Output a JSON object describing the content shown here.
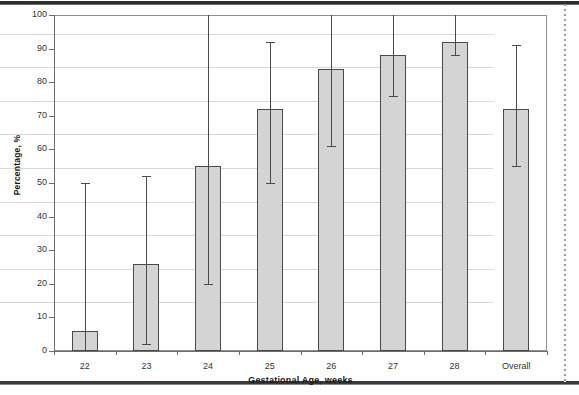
{
  "chart_data": {
    "type": "bar",
    "title": "",
    "xlabel": "Gestational Age, weeks",
    "ylabel": "Percentage, %",
    "categories": [
      "22",
      "23",
      "24",
      "25",
      "26",
      "27",
      "28",
      "Overall"
    ],
    "values": [
      6,
      26,
      55,
      72,
      84,
      88,
      92,
      72
    ],
    "error_low": [
      0,
      2,
      20,
      50,
      61,
      76,
      88,
      55
    ],
    "error_high": [
      50,
      52,
      100,
      92,
      100,
      100,
      100,
      91
    ],
    "ylim": [
      0,
      100
    ],
    "ytick_labels": [
      "0",
      "10",
      "20",
      "30",
      "40",
      "50",
      "60",
      "70",
      "80",
      "90",
      "100"
    ],
    "ytick_values": [
      0,
      10,
      20,
      30,
      40,
      50,
      60,
      70,
      80,
      90,
      100
    ],
    "grid": true,
    "legend": null,
    "bar_color": "#d4d4d4",
    "bar_edge_color": "#4a4a4a",
    "error_bar_color": "#4a4a4a",
    "grid_color": "#d8d8d8",
    "axis_color": "#6d6d6d"
  }
}
